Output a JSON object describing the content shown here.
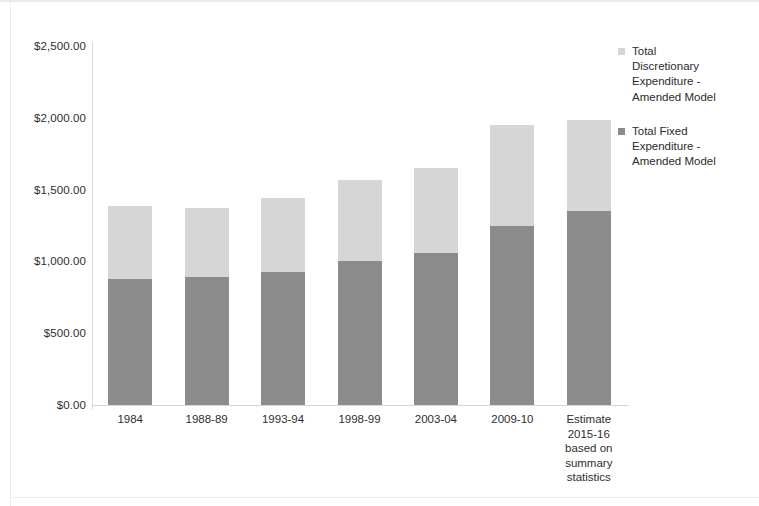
{
  "chart_data": {
    "type": "bar",
    "stacked": true,
    "title": "",
    "subtitle": "",
    "xlabel": "",
    "ylabel": "",
    "grid": false,
    "legend_position": "right",
    "ylim": [
      0,
      2500
    ],
    "ytick_values": [
      2500,
      2000,
      1500,
      1000,
      500,
      0
    ],
    "ytick_labels": [
      "$2,500.00",
      "$2,000.00",
      "$1,500.00",
      "$1,000.00",
      "$500.00",
      "$0.00"
    ],
    "categories": [
      "1984",
      "1988-89",
      "1993-94",
      "1998-99",
      "2003-04",
      "2009-10",
      "Estimate\n2015-16\nbased on\nsummary\nstatistics"
    ],
    "series": [
      {
        "name": "Total Fixed Expenditure - Amended Model",
        "legend_label": "Total Fixed\nExpenditure -\nAmended Model",
        "color": "#8c8c8c",
        "values": [
          875,
          890,
          925,
          1000,
          1060,
          1245,
          1350
        ]
      },
      {
        "name": "Total Discretionary Expenditure - Amended Model",
        "legend_label": "Total\nDiscretionary\nExpenditure  -\nAmended Model",
        "color": "#d6d6d6",
        "values": [
          510,
          485,
          515,
          565,
          590,
          705,
          635
        ]
      }
    ],
    "totals": [
      1385,
      1375,
      1440,
      1565,
      1650,
      1950,
      1985
    ]
  },
  "colors": {
    "fixed": "#8c8c8c",
    "discretionary": "#d6d6d6",
    "axis": "#d6d6d6",
    "text": "#2e2e2e",
    "background": "#ffffff"
  },
  "legend": {
    "items": [
      {
        "label": "Total\nDiscretionary\nExpenditure  -\nAmended Model",
        "color": "#d6d6d6"
      },
      {
        "label": "Total Fixed\nExpenditure -\nAmended Model",
        "color": "#8c8c8c"
      }
    ]
  }
}
